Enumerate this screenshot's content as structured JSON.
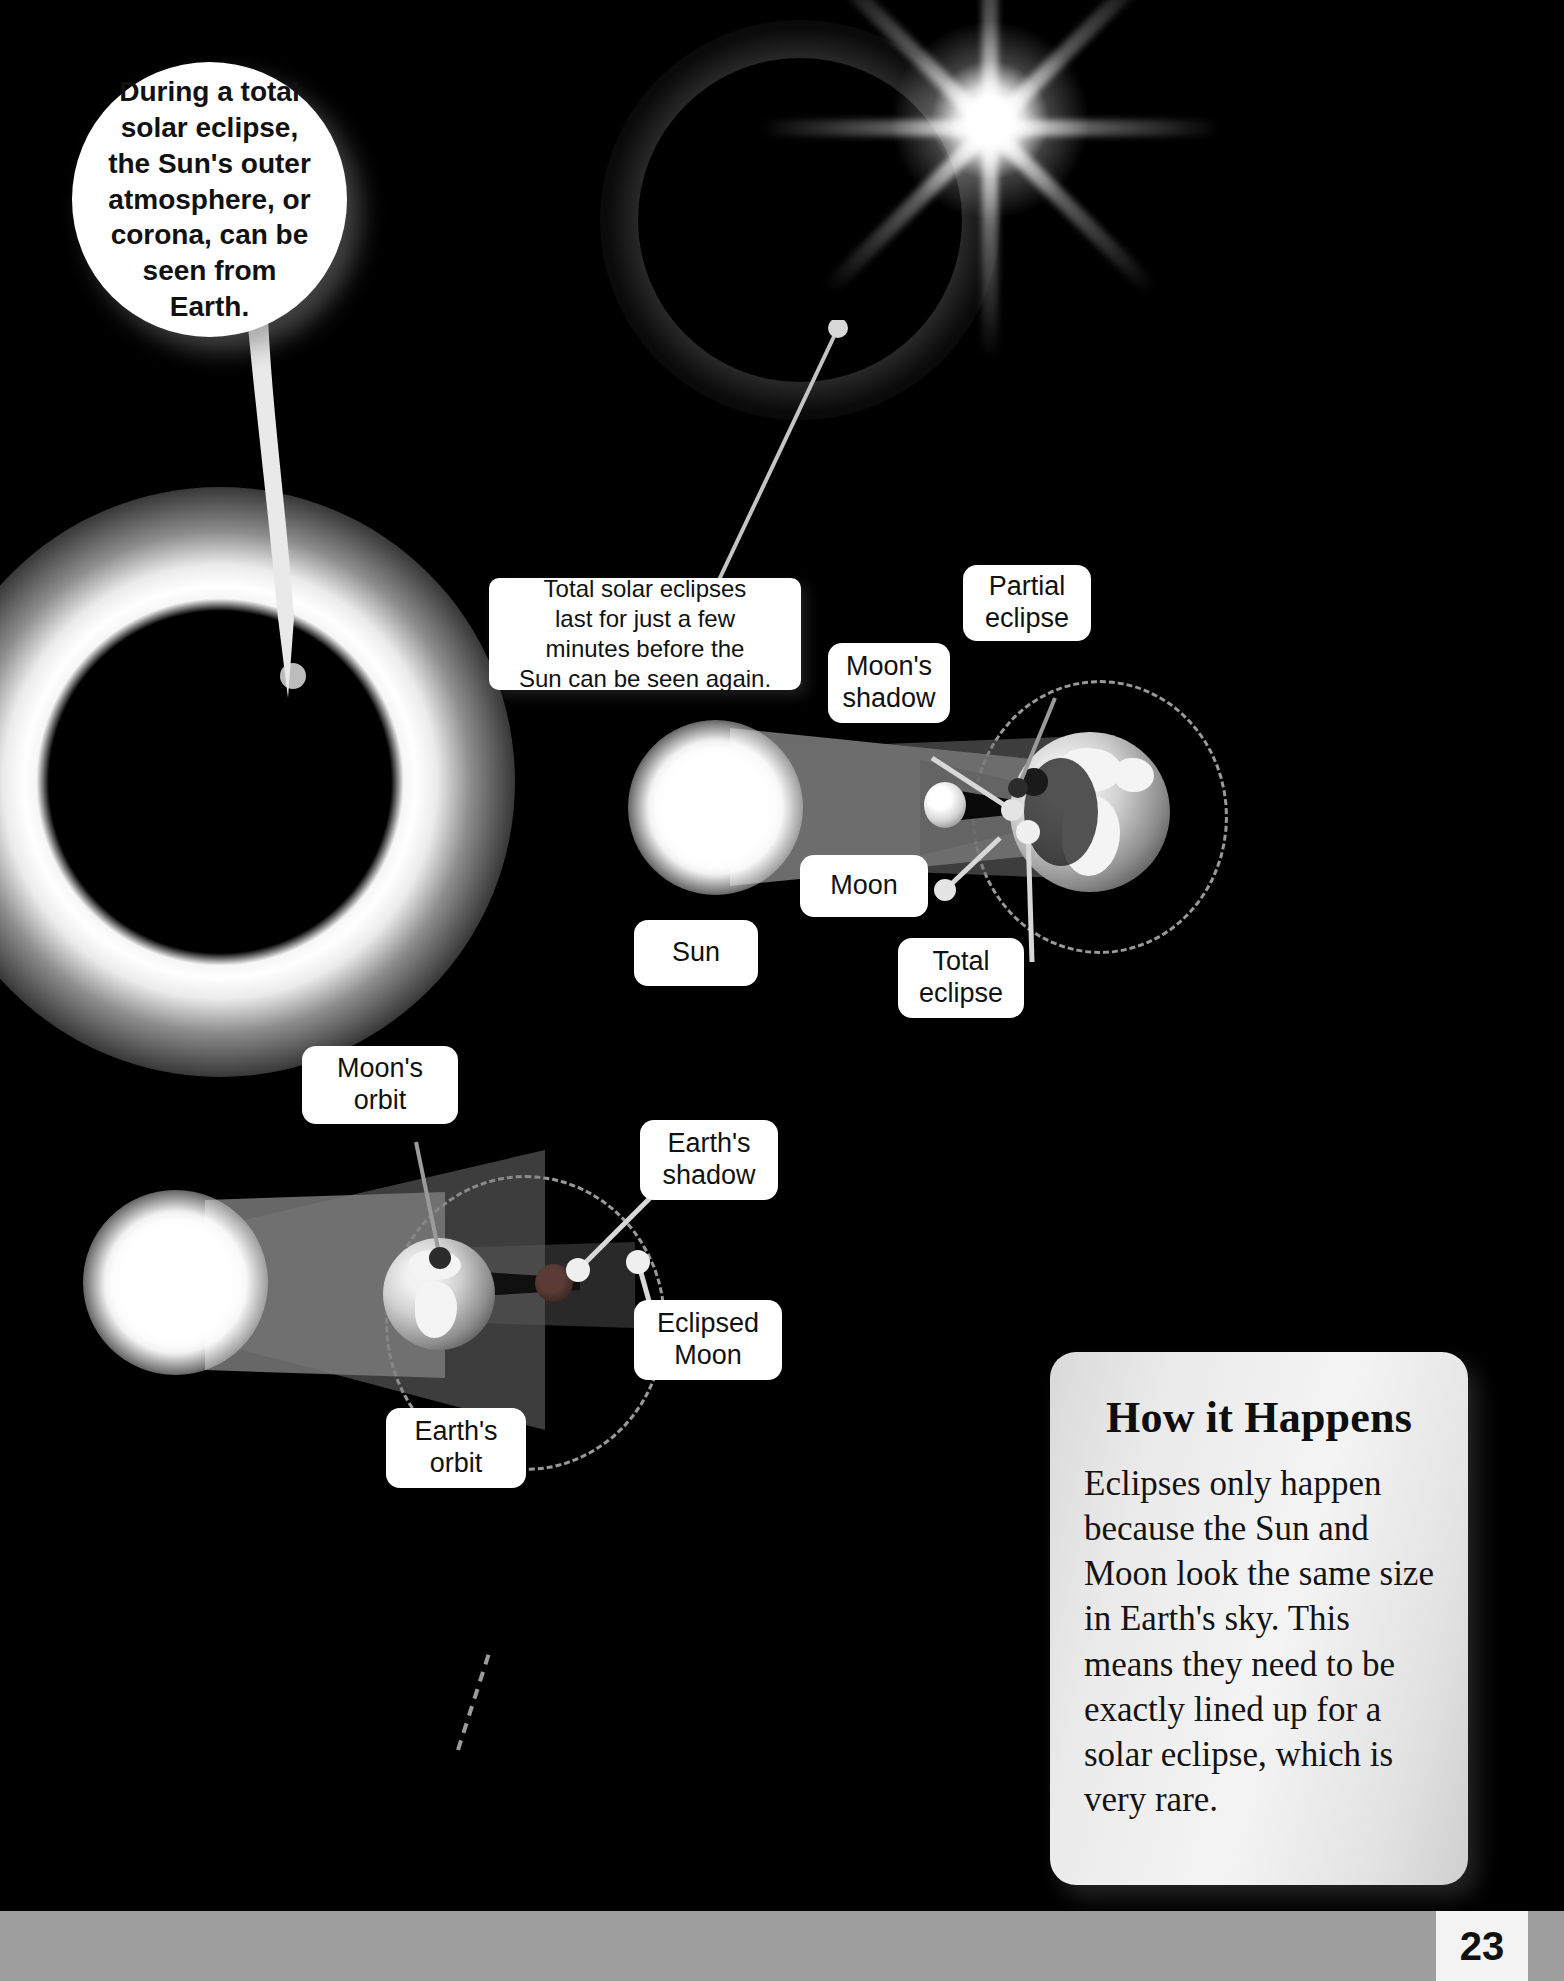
{
  "page": {
    "background_color": "#000000",
    "footer_color": "#9e9e9e",
    "page_number": "23"
  },
  "speech_bubble": {
    "text": "During a total\nsolar eclipse,\nthe Sun's outer\natmosphere, or\ncorona, can be\nseen from\nEarth."
  },
  "rect_callout": {
    "text": "Total solar eclipses\nlast for just a few\nminutes before the\nSun can be seen again."
  },
  "solar_diagram": {
    "labels": {
      "sun": "Sun",
      "moon": "Moon",
      "moons_shadow": "Moon's\nshadow",
      "partial_eclipse": "Partial\neclipse",
      "total_eclipse": "Total\neclipse"
    }
  },
  "lunar_diagram": {
    "labels": {
      "moons_orbit": "Moon's\norbit",
      "earths_shadow": "Earth's\nshadow",
      "eclipsed_moon": "Eclipsed\nMoon",
      "earths_orbit": "Earth's\norbit"
    }
  },
  "how_it_happens": {
    "title": "How it Happens",
    "body": "Eclipses only happen because the Sun and Moon look the same size in Earth's sky. This means they need to be exactly lined up for a solar eclipse, which is very rare."
  }
}
